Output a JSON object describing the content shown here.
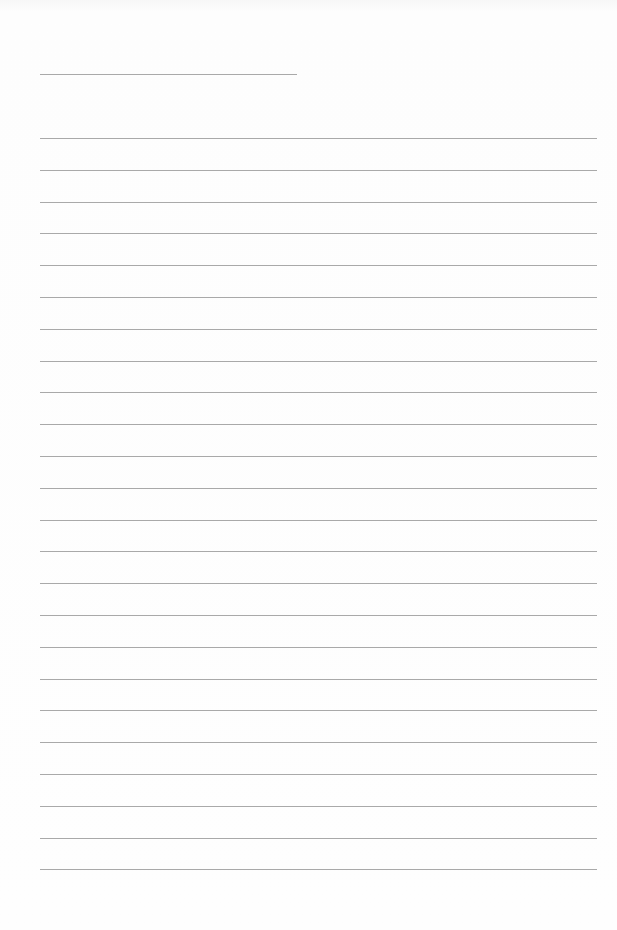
{
  "document": {
    "type": "lined-paper",
    "background_color": "#fdfdfd",
    "rule_color": "#a9a9a9",
    "title_line": {
      "left": 40,
      "top": 74,
      "width": 257
    },
    "body_lines": {
      "count": 24,
      "first_top": 138,
      "spacing": 31.8,
      "left": 40,
      "right": 597
    }
  }
}
